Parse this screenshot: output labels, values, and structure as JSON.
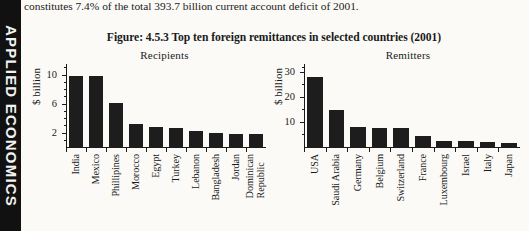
{
  "sidebar": {
    "label": "APPLIED ECONOMICS"
  },
  "body_text": {
    "clipped_line": "transfer and private foreign flows, the US$29.2 billion leaving the country as remittances",
    "line": "constitutes 7.4% of the total 393.7 billion current account deficit of 2001."
  },
  "figure": {
    "title": "Figure: 4.5.3 Top ten foreign remittances in selected countries (2001)"
  },
  "chart_data": [
    {
      "type": "bar",
      "title": "Recipients",
      "xlabel": "",
      "ylabel": "$ billion",
      "categories": [
        "India",
        "Mexico",
        "Phillipines",
        "Morocco",
        "Egypt",
        "Turkey",
        "Lebanon",
        "Bangladesh",
        "Jordan",
        "Dominican Republic"
      ],
      "values": [
        10.0,
        9.9,
        6.2,
        3.3,
        2.9,
        2.8,
        2.3,
        2.1,
        2.0,
        2.0
      ],
      "ylim": [
        0,
        11.6
      ],
      "yticks": [
        2,
        6,
        10
      ],
      "ytick_labels": [
        "2",
        "6",
        "10"
      ],
      "yminor": [
        1,
        3,
        4,
        5,
        7,
        8,
        9,
        11
      ],
      "grid": false,
      "legend": false
    },
    {
      "type": "bar",
      "title": "Remitters",
      "xlabel": "",
      "ylabel": "$ billion",
      "categories": [
        "USA",
        "Saudi Arabia",
        "Germany",
        "Belgium",
        "Switzerland",
        "France",
        "Luxembourg",
        "Israel",
        "Italy",
        "Japan"
      ],
      "values": [
        28.4,
        15.1,
        8.2,
        8.1,
        8.0,
        4.9,
        2.8,
        2.6,
        2.4,
        2.0
      ],
      "ylim": [
        0,
        33.5
      ],
      "yticks": [
        10,
        20,
        30
      ],
      "ytick_labels": [
        "10",
        "20",
        "30"
      ],
      "yminor": [
        5,
        15,
        25,
        32
      ],
      "grid": false,
      "legend": false
    }
  ]
}
